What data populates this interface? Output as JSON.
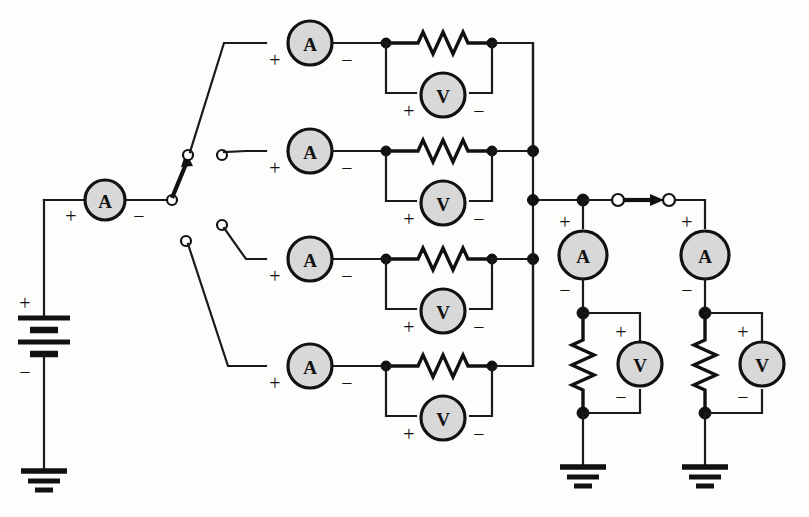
{
  "diagram": {
    "background_color": "#fdfdfc",
    "line_color": "#111111",
    "meter_fill_color": "#d8d8d8"
  },
  "labels": {
    "ammeter": "A",
    "voltmeter": "V",
    "plus": "+",
    "minus": "−"
  },
  "source": {
    "name": "battery",
    "plus_label": "+",
    "minus_label": "−",
    "cells": 2,
    "ground_label": "ground"
  },
  "main_ammeter": {
    "label": "A",
    "plus_label": "+",
    "minus_label": "−"
  },
  "selector_switch": {
    "name": "rotary-selector-switch",
    "pivot_contacts": 2,
    "open_contacts": 4,
    "selected_branch_index": 0,
    "arrow_direction": "up-right"
  },
  "branches": [
    {
      "index": 0,
      "ammeter_label": "A",
      "ammeter_plus": "+",
      "ammeter_minus": "−",
      "resistor": "resistor",
      "voltmeter_label": "V",
      "voltmeter_plus": "+",
      "voltmeter_minus": "−"
    },
    {
      "index": 1,
      "ammeter_label": "A",
      "ammeter_plus": "+",
      "ammeter_minus": "−",
      "resistor": "resistor",
      "voltmeter_label": "V",
      "voltmeter_plus": "+",
      "voltmeter_minus": "−"
    },
    {
      "index": 2,
      "ammeter_label": "A",
      "ammeter_plus": "+",
      "ammeter_minus": "−",
      "resistor": "resistor",
      "voltmeter_label": "V",
      "voltmeter_plus": "+",
      "voltmeter_minus": "−"
    },
    {
      "index": 3,
      "ammeter_label": "A",
      "ammeter_plus": "+",
      "ammeter_minus": "−",
      "resistor": "resistor",
      "voltmeter_label": "V",
      "voltmeter_plus": "+",
      "voltmeter_minus": "−"
    }
  ],
  "load_branches": [
    {
      "index": 0,
      "ammeter_label": "A",
      "ammeter_plus": "+",
      "ammeter_minus": "−",
      "resistor": "resistor",
      "voltmeter_label": "V",
      "voltmeter_plus": "+",
      "voltmeter_minus": "−",
      "ground_label": "ground"
    },
    {
      "index": 1,
      "ammeter_label": "A",
      "ammeter_plus": "+",
      "ammeter_minus": "−",
      "resistor": "resistor",
      "voltmeter_label": "V",
      "voltmeter_plus": "+",
      "voltmeter_minus": "−",
      "ground_label": "ground"
    }
  ],
  "inline_switch": {
    "name": "inline-switch",
    "contacts": 2,
    "arrow_direction": "right"
  }
}
